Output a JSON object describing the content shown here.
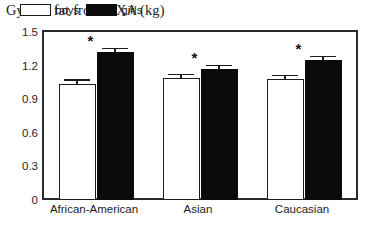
{
  "chart_data": {
    "type": "bar",
    "title": "Gynoid fat from DXA (kg)",
    "xlabel": "",
    "ylabel": "",
    "ylim": [
      0,
      1.5
    ],
    "yticks": [
      "0",
      "0.3",
      "0.6",
      "0.9",
      "1.2",
      "1.5"
    ],
    "ytick_values": [
      0,
      0.3,
      0.6,
      0.9,
      1.2,
      1.5
    ],
    "grid": false,
    "legend_position": "top-left-inside",
    "categories": [
      "African-American",
      "Asian",
      "Caucasian"
    ],
    "series": [
      {
        "name": "boys",
        "color": "#ffffff",
        "values": [
          1.04,
          1.09,
          1.08
        ],
        "errors": [
          0.03,
          0.03,
          0.03
        ]
      },
      {
        "name": "girls",
        "color": "#000000",
        "values": [
          1.32,
          1.17,
          1.25
        ],
        "errors": [
          0.03,
          0.03,
          0.03
        ]
      }
    ],
    "annotations": [
      {
        "text": "*",
        "category": "African-American",
        "series": "girls"
      },
      {
        "text": "*",
        "category": "Asian",
        "series": "girls"
      },
      {
        "text": "*",
        "category": "Caucasian",
        "series": "girls"
      }
    ],
    "significance_marker": "*"
  },
  "legend": {
    "entries": [
      {
        "label": "boys",
        "swatch": "white-square-outline"
      },
      {
        "label": "girls",
        "swatch": "black-square-filled"
      }
    ]
  }
}
